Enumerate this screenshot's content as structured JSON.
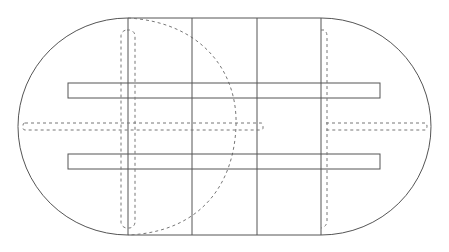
{
  "diagram": {
    "canvas": {
      "width": 449,
      "height": 252,
      "background": "#ffffff"
    },
    "colors": {
      "solid_line": "#555555",
      "dashed_line": "#777777"
    },
    "outline": {
      "top_y": 18,
      "bottom_y": 235,
      "left_straight_x": 128,
      "right_straight_x": 321,
      "left_arc_leftmost_x": 18,
      "right_arc_rightmost_x": 431
    },
    "panel_dividers_x": [
      128,
      192,
      257,
      321
    ],
    "rails": [
      {
        "x": 68,
        "y": 83,
        "width": 312,
        "height": 15
      },
      {
        "x": 68,
        "y": 154,
        "width": 312,
        "height": 15
      }
    ],
    "hidden_slides": {
      "left_vertical": {
        "x": 121,
        "y": 30,
        "width": 14,
        "height": 198
      },
      "right_vertical": {
        "x": 320,
        "y": 30,
        "width": 7,
        "height": 198
      },
      "left_horizontal": {
        "x": 23,
        "y": 123,
        "width": 240,
        "height": 7
      },
      "right_horizontal": {
        "x": 326,
        "y": 123,
        "width": 102,
        "height": 7
      }
    },
    "hidden_leaf_arc": {
      "start": [
        128,
        18
      ],
      "control": [
        250,
        40
      ],
      "end": [
        128,
        235
      ]
    }
  }
}
